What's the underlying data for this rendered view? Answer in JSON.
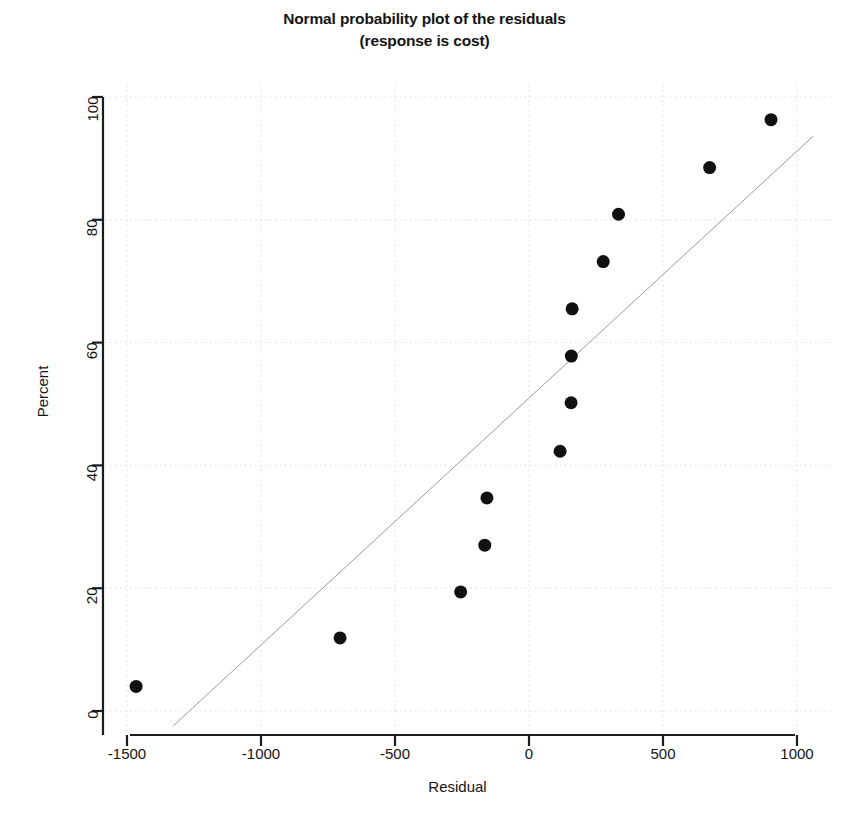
{
  "chart_data": {
    "type": "scatter",
    "title": "Normal probability plot of the residuals",
    "subtitle": "(response is cost)",
    "xlabel": "Residual",
    "ylabel": "Percent",
    "xlim": [
      -1650,
      1060
    ],
    "ylim": [
      -2.5,
      103
    ],
    "xticks": [
      -1500,
      -1000,
      -500,
      0,
      500,
      1000
    ],
    "yticks": [
      0,
      20,
      40,
      60,
      80,
      100
    ],
    "xtick_labels": [
      "-1500",
      "-1000",
      "-500",
      "0",
      "500",
      "1000"
    ],
    "ytick_labels": [
      "0",
      "20",
      "40",
      "60",
      "80",
      "100"
    ],
    "grid": true,
    "grid_style": "dotted-light",
    "legend": null,
    "marker": {
      "shape": "circle",
      "color": "#111111",
      "size_px": 13
    },
    "series": [
      {
        "name": "residual percentiles",
        "points": [
          {
            "x": -1466,
            "y": 4.0
          },
          {
            "x": -705,
            "y": 11.9
          },
          {
            "x": -255,
            "y": 19.4
          },
          {
            "x": -165,
            "y": 27.0
          },
          {
            "x": -157,
            "y": 34.7
          },
          {
            "x": 116,
            "y": 42.3
          },
          {
            "x": 157,
            "y": 50.2
          },
          {
            "x": 158,
            "y": 57.8
          },
          {
            "x": 161,
            "y": 65.5
          },
          {
            "x": 277,
            "y": 73.2
          },
          {
            "x": 334,
            "y": 80.9
          },
          {
            "x": 674,
            "y": 88.5
          },
          {
            "x": 903,
            "y": 96.3
          }
        ]
      }
    ],
    "reference_line": {
      "name": "normal reference line",
      "color": "#9a9a9a",
      "width_px": 1,
      "x0": -1327,
      "y0": -2.4,
      "x1": 1060,
      "y1": 93.6
    }
  }
}
